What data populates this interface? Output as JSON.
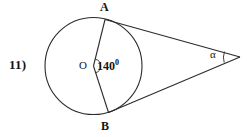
{
  "figure": {
    "problem_number": "11)",
    "center_label": "O",
    "point_a_label": "A",
    "point_b_label": "B",
    "central_angle_value": "140",
    "central_angle_degree_symbol": "0",
    "exterior_angle_label": "α",
    "stroke_color": "#2b2b2b",
    "fill_color": "#ffffff",
    "text_color": "#141414",
    "background_color": "#ffffff"
  },
  "geometry": {
    "circle": {
      "cx": 93.5,
      "cy": 66,
      "r": 48.5
    },
    "point_a": {
      "x": 105,
      "y": 19.5
    },
    "point_b": {
      "x": 108.5,
      "y": 112.5
    },
    "apex": {
      "x": 240,
      "y": 57
    },
    "center": {
      "x": 93.5,
      "y": 66
    },
    "angle_arc_radius": 7
  }
}
